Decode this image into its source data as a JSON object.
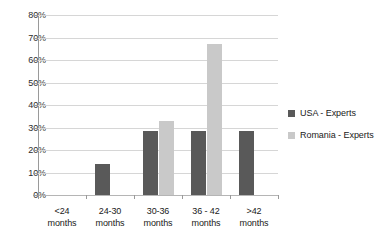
{
  "chart_data": {
    "type": "bar",
    "title": "",
    "subtitle": "",
    "xlabel": "",
    "ylabel": "",
    "categories": [
      "<24\nmonths",
      "24-30\nmonths",
      "30-36\nmonths",
      "36 - 42\nmonths",
      ">42\nmonths"
    ],
    "category_lines": [
      [
        "<24",
        "months"
      ],
      [
        "24-30",
        "months"
      ],
      [
        "30-36",
        "months"
      ],
      [
        "36 - 42",
        "months"
      ],
      [
        ">42",
        "months"
      ]
    ],
    "series": [
      {
        "name": "USA - Experts",
        "color": "#595959",
        "values": [
          0,
          14,
          28.5,
          28.5,
          28.5
        ]
      },
      {
        "name": "Romania - Experts",
        "color": "#c9c9c9",
        "values": [
          0,
          0,
          33,
          67,
          0
        ]
      }
    ],
    "ylim": [
      0,
      80
    ],
    "ytick_values": [
      0,
      10,
      20,
      30,
      40,
      50,
      60,
      70,
      80
    ],
    "ytick_labels": [
      "0%",
      "10%",
      "20%",
      "30%",
      "40%",
      "50%",
      "60%",
      "70%",
      "80%"
    ],
    "grid": "horizontal",
    "legend_position": "right",
    "value_format": "percent"
  },
  "legend": {
    "entries": [
      {
        "label": "USA - Experts",
        "color": "#595959"
      },
      {
        "label": "Romania - Experts",
        "color": "#c9c9c9"
      }
    ]
  },
  "axis": {
    "y_labels": [
      "80%",
      "70%",
      "60%",
      "50%",
      "40%",
      "30%",
      "20%",
      "10%",
      "0%"
    ]
  }
}
